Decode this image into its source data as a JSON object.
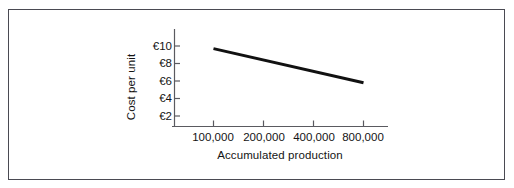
{
  "figure": {
    "border_color": "#4a4a52",
    "background": "#ffffff"
  },
  "chart_data": {
    "type": "line",
    "title": "",
    "subtitle": "",
    "xlabel": "Accumulated production",
    "ylabel": "Cost per unit",
    "x_scale": "log2",
    "x_tick_values": [
      100000,
      200000,
      400000,
      800000
    ],
    "x_tick_labels": [
      "100,000",
      "200,000",
      "400,000",
      "800,000"
    ],
    "y_tick_values": [
      2,
      4,
      6,
      8,
      10
    ],
    "y_tick_labels": [
      "€2",
      "€4",
      "€6",
      "€8",
      "€10"
    ],
    "ylim": [
      0,
      11
    ],
    "grid": false,
    "legend": false,
    "legend_position": "none",
    "currency_symbol": "€",
    "series": [
      {
        "name": "Experience curve",
        "color": "#111111",
        "line_width": 3,
        "x": [
          100000,
          800000
        ],
        "y": [
          9.7,
          5.8
        ],
        "points": [
          {
            "x": 100000,
            "y": 9.7
          },
          {
            "x": 200000,
            "y": 8.4
          },
          {
            "x": 400000,
            "y": 7.1
          },
          {
            "x": 800000,
            "y": 5.8
          }
        ]
      }
    ],
    "annotations": []
  },
  "axes": {
    "y_axis_name": "cost-per-unit-axis",
    "x_axis_name": "accumulated-production-axis"
  }
}
